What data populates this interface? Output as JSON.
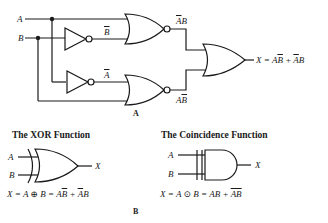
{
  "figure": {
    "part_a": {
      "caption": "A",
      "inputs": {
        "a": "A",
        "b": "B"
      },
      "inverter_outputs": {
        "not_b": "B",
        "not_a": "A"
      },
      "nor_outputs": {
        "upper": {
          "first": "A",
          "first_bar": true,
          "second": "B",
          "second_bar": false
        },
        "lower": {
          "first": "A",
          "first_bar": false,
          "second": "B",
          "second_bar": true
        }
      },
      "output": {
        "lhs": "X = A",
        "term1_bar": "B",
        "plus": " + ",
        "term2_bar": "A",
        "term2_rest": "B"
      }
    },
    "part_b": {
      "caption": "B",
      "xor": {
        "title": "The XOR Function",
        "input_a": "A",
        "input_b": "B",
        "output": "X",
        "eq_left": "X = A ",
        "operator": "⊕",
        "eq_mid": " B = A",
        "eq_bar1": "B",
        "eq_plus": " + ",
        "eq_bar2": "A",
        "eq_end": "B"
      },
      "coincidence": {
        "title": "The Coincidence Function",
        "input_a": "A",
        "input_b": "B",
        "output": "X",
        "eq_left": "X = A ",
        "operator": "⊙",
        "eq_mid": " B = AB + ",
        "eq_bar": "AB"
      }
    },
    "colors": {
      "line": "#1a1a1a",
      "background": "#ffffff"
    }
  }
}
